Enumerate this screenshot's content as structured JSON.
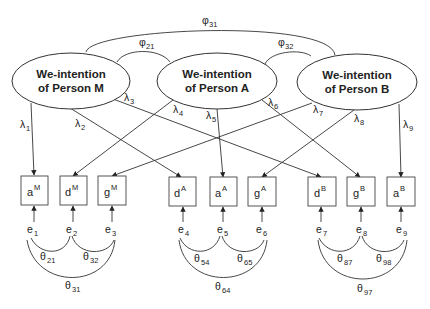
{
  "diagram": {
    "type": "structural-equation-model",
    "latents": [
      {
        "id": "M",
        "line1": "We-intention",
        "line2": "of Person M",
        "cx": 71,
        "cy": 81
      },
      {
        "id": "A",
        "line1": "We-intention",
        "line2": "of Person A",
        "cx": 217,
        "cy": 81
      },
      {
        "id": "B",
        "line1": "We-intention",
        "line2": "of Person B",
        "cx": 357,
        "cy": 82
      }
    ],
    "covariances_latent": [
      {
        "label": "φ",
        "sub": "21",
        "from": "M",
        "to": "A"
      },
      {
        "label": "φ",
        "sub": "32",
        "from": "A",
        "to": "B"
      },
      {
        "label": "φ",
        "sub": "31",
        "from": "M",
        "to": "B"
      }
    ],
    "indicators": [
      {
        "base": "a",
        "sup": "M",
        "x": 21
      },
      {
        "base": "d",
        "sup": "M",
        "x": 60
      },
      {
        "base": "g",
        "sup": "M",
        "x": 98
      },
      {
        "base": "d",
        "sup": "A",
        "x": 169
      },
      {
        "base": "a",
        "sup": "A",
        "x": 210
      },
      {
        "base": "g",
        "sup": "A",
        "x": 248
      },
      {
        "base": "d",
        "sup": "B",
        "x": 308
      },
      {
        "base": "g",
        "sup": "B",
        "x": 347
      },
      {
        "base": "a",
        "sup": "B",
        "x": 387
      }
    ],
    "loadings": [
      {
        "label": "λ",
        "sub": "1",
        "from": "M",
        "to": "aM"
      },
      {
        "label": "λ",
        "sub": "2",
        "from": "M",
        "to": "dA"
      },
      {
        "label": "λ",
        "sub": "3",
        "from": "M",
        "to": "dB"
      },
      {
        "label": "λ",
        "sub": "4",
        "from": "A",
        "to": "dM"
      },
      {
        "label": "λ",
        "sub": "5",
        "from": "A",
        "to": "aA"
      },
      {
        "label": "λ",
        "sub": "6",
        "from": "A",
        "to": "gB"
      },
      {
        "label": "λ",
        "sub": "7",
        "from": "B",
        "to": "gM"
      },
      {
        "label": "λ",
        "sub": "8",
        "from": "B",
        "to": "gA"
      },
      {
        "label": "λ",
        "sub": "9",
        "from": "B",
        "to": "aB"
      }
    ],
    "errors": [
      {
        "label": "e",
        "sub": "1"
      },
      {
        "label": "e",
        "sub": "2"
      },
      {
        "label": "e",
        "sub": "3"
      },
      {
        "label": "e",
        "sub": "4"
      },
      {
        "label": "e",
        "sub": "5"
      },
      {
        "label": "e",
        "sub": "6"
      },
      {
        "label": "e",
        "sub": "7"
      },
      {
        "label": "e",
        "sub": "8"
      },
      {
        "label": "e",
        "sub": "9"
      }
    ],
    "error_covariances": [
      {
        "label": "θ",
        "sub": "21"
      },
      {
        "label": "θ",
        "sub": "32"
      },
      {
        "label": "θ",
        "sub": "31"
      },
      {
        "label": "θ",
        "sub": "54"
      },
      {
        "label": "θ",
        "sub": "65"
      },
      {
        "label": "θ",
        "sub": "64"
      },
      {
        "label": "θ",
        "sub": "87"
      },
      {
        "label": "θ",
        "sub": "98"
      },
      {
        "label": "θ",
        "sub": "97"
      }
    ]
  }
}
